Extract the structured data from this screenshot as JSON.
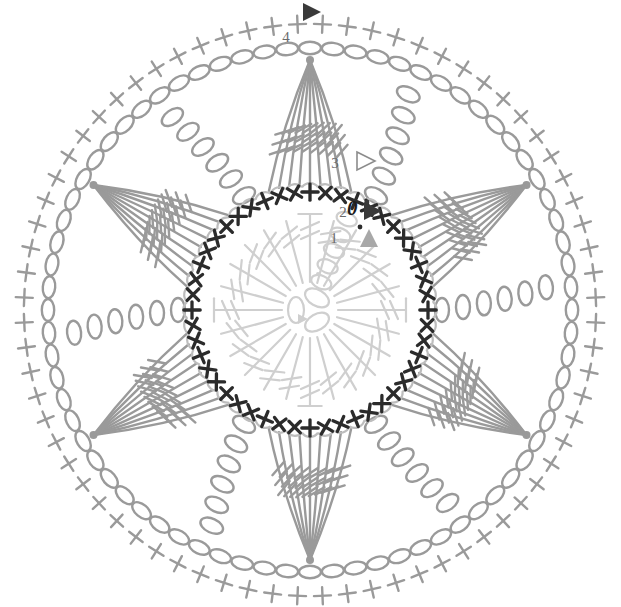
{
  "diagram": {
    "type": "crochet-stitch-diagram",
    "canvas": {
      "width": 621,
      "height": 607
    },
    "center": {
      "x": 310,
      "y": 310
    },
    "colors": {
      "round1": "#cfcfcf",
      "round2": "#2b2b2b",
      "round3": "#9a9a9a",
      "round4": "#9a9a9a",
      "label": "#6b6b6b",
      "label_dark": "#1d1d1d",
      "marker_dark": "#3a3a3a",
      "marker_mid": "#a8a8a8",
      "marker_outline": "#8c8c8c",
      "background": "#ffffff"
    },
    "round_labels": [
      {
        "id": "1",
        "text": "1",
        "x": 334,
        "y": 243,
        "style": "plain",
        "marker": "triangle-filled-gray",
        "marker_x": 369,
        "marker_y": 238,
        "dot_x": 360,
        "dot_y": 227
      },
      {
        "id": "2",
        "text": "2",
        "x": 343,
        "y": 217,
        "style": "plain",
        "marker": "triangle-filled-dark",
        "marker_x": 373,
        "marker_y": 211,
        "dot_x": 367,
        "dot_y": 202
      },
      {
        "id": "3",
        "text": "3",
        "x": 335,
        "y": 168,
        "style": "plain",
        "marker": "triangle-outline",
        "marker_x": 366,
        "marker_y": 161
      },
      {
        "id": "4",
        "text": "4",
        "x": 286,
        "y": 42,
        "style": "plain",
        "marker": "triangle-filled-dark",
        "marker_x": 312,
        "marker_y": 12
      }
    ],
    "start_ring_symbol": {
      "text": "0",
      "x": 347,
      "y": 215,
      "note": "italic zero marking round-2 start chain"
    },
    "rounds": [
      {
        "number": 1,
        "name": "center-ring-trebles",
        "color": "#cfcfcf",
        "stitch": "treble",
        "count": 24,
        "radius_inner": 28,
        "radius_outer": 96,
        "bars": 2
      },
      {
        "number": 2,
        "name": "single-crochet-ring",
        "color": "#2b2b2b",
        "stitch": "single-crochet",
        "symbol": "+",
        "count": 48,
        "radius": 118
      },
      {
        "number": 3,
        "name": "petal-round",
        "color": "#9a9a9a",
        "stitch": "long-treble",
        "petals": 6,
        "strands_per_petal": 9,
        "bars": 3,
        "radius_tip": 250
      },
      {
        "number": 4,
        "name": "outer-chain-and-sc-edge",
        "color": "#9a9a9a",
        "stitch": "chain + single-crochet",
        "chain_count": 72,
        "sc_count": 72,
        "radius_chain": 262,
        "radius_sc": 286
      }
    ]
  }
}
